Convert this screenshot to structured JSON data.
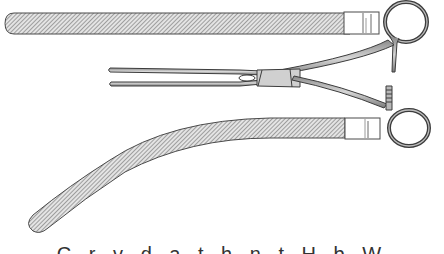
{
  "figure": {
    "components": [
      {
        "id": "straight-jaw",
        "label": "straight jaw (cross-hatched)"
      },
      {
        "id": "forceps",
        "label": "clamp forceps in profile"
      },
      {
        "id": "curved-jaw",
        "label": "curved jaw (cross-hatched)"
      }
    ],
    "colors": {
      "background": "#ffffff",
      "ink": "#3a3a3a",
      "hatch": "#7a7a7a",
      "fill": "#d8d8d8"
    }
  },
  "caption": {
    "text": "C  r  v  d  a  t  h  n  t  H  b  W",
    "note": "caption truncated at bottom edge; only letter tops visible"
  }
}
